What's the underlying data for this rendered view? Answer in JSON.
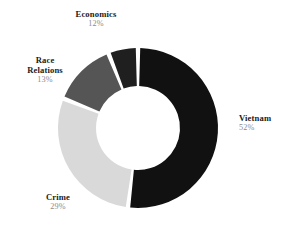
{
  "chart_data": {
    "type": "pie",
    "variant": "donut",
    "title": "",
    "subtitle": "",
    "xlabel": "",
    "ylabel": "",
    "legend_position": "none",
    "grid": false,
    "labels_outside": true,
    "start_angle_deg": 0,
    "direction": "clockwise",
    "background_color": "#ffffff",
    "categories": [
      "Vietnam",
      "Crime",
      "Race Relations",
      "Economics"
    ],
    "values": [
      52,
      29,
      13,
      12
    ],
    "value_suffix": "%",
    "colors": [
      "#111111",
      "#d9d9d9",
      "#555555",
      "#1f1f1f"
    ],
    "slices": [
      {
        "label": "Vietnam",
        "label_line1": "Vietnam",
        "label_line2": "",
        "value": 52,
        "value_text": "52%",
        "color": "#111111",
        "start_deg": 0,
        "end_deg": 187.2
      },
      {
        "label": "Crime",
        "label_line1": "Crime",
        "label_line2": "",
        "value": 29,
        "value_text": "29%",
        "color": "#d9d9d9",
        "start_deg": 187.2,
        "end_deg": 291.6
      },
      {
        "label": "Race Relations",
        "label_line1": "Race",
        "label_line2": "Relations",
        "value": 13,
        "value_text": "13%",
        "color": "#555555",
        "start_deg": 291.6,
        "end_deg": 338.4
      },
      {
        "label": "Economics",
        "label_line1": "Economics",
        "label_line2": "",
        "value": 12,
        "value_text": "12%",
        "color": "#1f1f1f",
        "start_deg": 338.4,
        "end_deg": 360
      }
    ]
  },
  "geometry": {
    "center_x": 138,
    "center_y": 128,
    "outer_radius": 80,
    "inner_radius": 42,
    "gap_deg": 3.2
  }
}
